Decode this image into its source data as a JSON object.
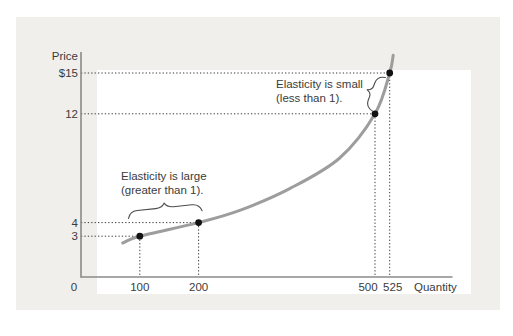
{
  "colors": {
    "page_bg": "#ffffff",
    "panel_bg": "#f0efec",
    "plot_bg": "#ffffff",
    "axis": "#8a8a8a",
    "curve": "#9d9d9d",
    "dot": "#121212",
    "dotted": "#3a3a3a",
    "text": "#3b3b3b",
    "brace": "#4c4c4c"
  },
  "chart_data": {
    "type": "line",
    "title": "",
    "xlabel": "Quantity",
    "ylabel": "Price",
    "origin_label": "0",
    "xlim": [
      0,
      636
    ],
    "ylim": [
      0,
      16.5
    ],
    "grid": false,
    "curve_description": "upward-sloping convex curve; elasticity large (flat region, left) to small (steep region, right)",
    "points": [
      {
        "quantity": 100,
        "price": 3,
        "price_label": "3",
        "quantity_label": "100",
        "label_dx": 0
      },
      {
        "quantity": 200,
        "price": 4,
        "price_label": "4",
        "quantity_label": "200",
        "label_dx": 0
      },
      {
        "quantity": 500,
        "price": 12,
        "price_label": "12",
        "quantity_label": "500",
        "label_dx": -7
      },
      {
        "quantity": 525,
        "price": 15,
        "price_label": "$15",
        "quantity_label": "525",
        "label_dx": 3
      }
    ],
    "curve_samples": [
      [
        71,
        2.5
      ],
      [
        100,
        3
      ],
      [
        200,
        4
      ],
      [
        270,
        4.9
      ],
      [
        355,
        6.5
      ],
      [
        440,
        8.75
      ],
      [
        500,
        12
      ],
      [
        525,
        15
      ],
      [
        531,
        16.3
      ]
    ],
    "annotations": [
      {
        "id": "inelastic-region",
        "lines": [
          "Elasticity is small",
          "(less than 1)."
        ]
      },
      {
        "id": "elastic-region",
        "lines": [
          "Elasticity is large",
          "(greater than 1)."
        ]
      }
    ]
  }
}
